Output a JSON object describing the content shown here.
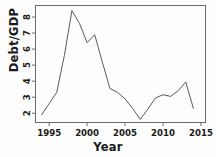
{
  "chart_data": {
    "type": "line",
    "title": "",
    "subtitle": "",
    "xlabel": "Year",
    "ylabel": "Debt/GDP",
    "x": [
      1994,
      1995,
      1996,
      1997,
      1998,
      1999,
      2000,
      2001,
      2002,
      2003,
      2004,
      2005,
      2006,
      2007,
      2008,
      2009,
      2010,
      2011,
      2012,
      2013,
      2014
    ],
    "values": [
      1.9,
      2.6,
      3.3,
      5.6,
      8.4,
      7.6,
      6.4,
      6.9,
      5.2,
      3.55,
      3.3,
      2.9,
      2.3,
      1.62,
      2.25,
      2.95,
      3.15,
      3.05,
      3.4,
      3.95,
      2.3
    ],
    "series": [
      {
        "name": "Debt/GDP",
        "values": [
          1.9,
          2.6,
          3.3,
          5.6,
          8.4,
          7.6,
          6.4,
          6.9,
          5.2,
          3.55,
          3.3,
          2.9,
          2.3,
          1.62,
          2.25,
          2.95,
          3.15,
          3.05,
          3.4,
          3.95,
          2.3
        ],
        "color": "#5a5a5a"
      }
    ],
    "xticks": [
      1995,
      2000,
      2005,
      2010,
      2015
    ],
    "xtick_labels": [
      "1995",
      "2000",
      "2005",
      "2010",
      "2015"
    ],
    "yticks": [
      2,
      3,
      4,
      5,
      6,
      7,
      8
    ],
    "ytick_labels": [
      "2",
      "3",
      "4",
      "5",
      "6",
      "7",
      "8"
    ],
    "xlim": [
      1993.2,
      2015.6
    ],
    "ylim": [
      1.42,
      8.72
    ],
    "grid": false,
    "legend": false,
    "legend_position": "none",
    "line_color": "#5a5a5a",
    "axis_color": "#6b6b6b",
    "background": "#fdfdfd"
  }
}
